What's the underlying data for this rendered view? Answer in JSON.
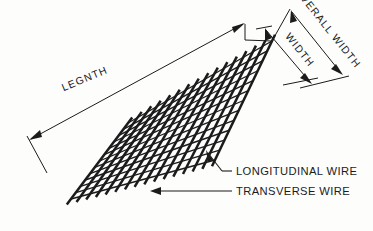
{
  "figure": {
    "kind": "engineering-line-drawing",
    "background_color": "#fdfdfc",
    "ink_color": "#1b1b1b"
  },
  "dimensions": {
    "length": {
      "label": "LEGNTH",
      "rotation_deg": -22.5,
      "x": 86,
      "y": 82
    },
    "width": {
      "label": "WIDTH",
      "rotation_deg": 61,
      "x": 306,
      "y": 47
    },
    "overall_width": {
      "label": "OVERALL WIDTH",
      "rotation_deg": 61,
      "x": 330,
      "y": 22
    }
  },
  "callouts": [
    {
      "id": "longitudinal",
      "label": "LONGITUDINAL WIRE",
      "x": 237,
      "y": 175,
      "leader_from": [
        233,
        171
      ],
      "leader_to": [
        206,
        151
      ]
    },
    {
      "id": "transverse",
      "label": "TRANSVERSE WIRE",
      "x": 237,
      "y": 195,
      "leader_from": [
        233,
        191
      ],
      "leader_to": [
        150,
        191
      ]
    }
  ],
  "mesh": {
    "transverse_wire_count": 16,
    "longitudinal_wire_count": 13,
    "transverse_wire_stroke": 2.5,
    "longitudinal_wire_stroke": 1.35,
    "corner_top_left": [
      128,
      123
    ],
    "corner_top_right": [
      272,
      41
    ],
    "corner_bottom_right": [
      215,
      160
    ],
    "corner_bottom_left": [
      71,
      199
    ],
    "overhang": 7
  }
}
